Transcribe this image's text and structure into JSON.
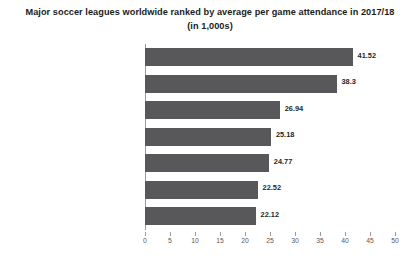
{
  "chart_data": {
    "type": "bar",
    "orientation": "horizontal",
    "title": "Major soccer leagues worldwide ranked by average per game attendance in 2017/18 (in 1,000s)",
    "xlabel": "",
    "ylabel": "",
    "xlim": [
      0,
      50
    ],
    "grid": false,
    "legend": null,
    "bar_color": "#58585a",
    "categories": [
      "Bundesliga (Germany)",
      "Premier League (England)",
      "Primera División (Spain)",
      "Primera División (Mexico)",
      "Serie A (Italy)",
      "Ligue 1 (France)",
      "Major League Soccer (North America)"
    ],
    "values": [
      41.52,
      38.3,
      26.94,
      25.18,
      24.77,
      22.52,
      22.12
    ],
    "value_labels": [
      "41.52",
      "38.3",
      "26.94",
      "25.18",
      "24.77",
      "22.52",
      "22.12"
    ],
    "xticks": [
      0,
      5,
      10,
      15,
      20,
      25,
      30,
      35,
      40,
      45,
      50
    ],
    "xtick_labels": [
      "0",
      "5",
      "10",
      "15",
      "20",
      "25",
      "30",
      "35",
      "40",
      "45",
      "50"
    ]
  }
}
